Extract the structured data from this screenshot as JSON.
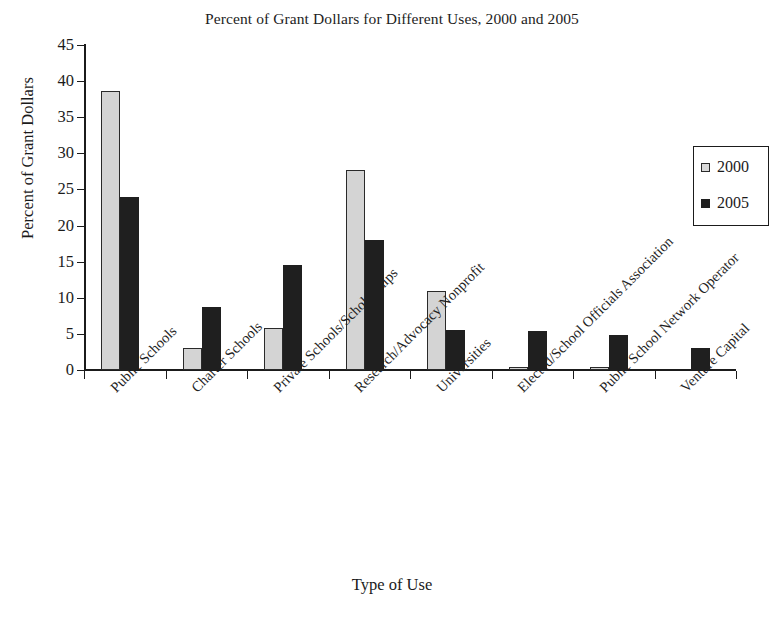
{
  "chart_data": {
    "type": "bar",
    "title": "Percent of Grant Dollars for Different Uses, 2000 and 2005",
    "xlabel": "Type of Use",
    "ylabel": "Percent of Grant Dollars",
    "ylim": [
      0,
      45
    ],
    "ytick_step": 5,
    "yticks": [
      0,
      5,
      10,
      15,
      20,
      25,
      30,
      35,
      40,
      45
    ],
    "grid": false,
    "legend_position": "right-upper-inside",
    "categories": [
      "Public Schools",
      "Charter Schools",
      "Private Schools/Scholarships",
      "Research/Advocacy Nonprofit",
      "Universities",
      "Elected/School Officials Association",
      "Public School Network Operator",
      "Venture Capital"
    ],
    "series": [
      {
        "name": "2000",
        "color": "#d4d4d4",
        "values": [
          38.6,
          3.0,
          5.8,
          27.7,
          10.9,
          0.4,
          0.4,
          0.0
        ]
      },
      {
        "name": "2005",
        "color": "#1f1f1f",
        "values": [
          24.0,
          8.7,
          14.6,
          18.0,
          5.5,
          5.4,
          4.9,
          3.0
        ]
      }
    ]
  },
  "legend": {
    "items": [
      {
        "label": "2000",
        "swatch": "light-square-swatch"
      },
      {
        "label": "2005",
        "swatch": "dark-square-swatch"
      }
    ]
  },
  "axes": {
    "y_tick_labels": [
      "45",
      "40",
      "35",
      "30",
      "25",
      "20",
      "15",
      "10",
      "5",
      "0"
    ]
  }
}
